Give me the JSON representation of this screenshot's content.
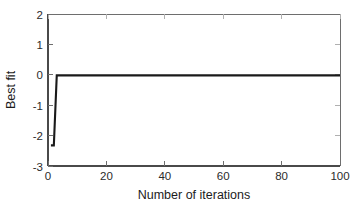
{
  "chart_data": {
    "type": "line",
    "title": "",
    "xlabel": "Number of iterations",
    "ylabel": "Best fit",
    "xlim": [
      0,
      100
    ],
    "ylim": [
      -3,
      2
    ],
    "xticks": [
      0,
      20,
      40,
      60,
      80,
      100
    ],
    "yticks": [
      2,
      1,
      0,
      -1,
      -2,
      -3
    ],
    "xtick_labels": [
      "0",
      "20",
      "40",
      "60",
      "80",
      "100"
    ],
    "ytick_labels": [
      "2",
      "1",
      "0",
      "-1",
      "-2",
      "-3"
    ],
    "grid": false,
    "legend": null,
    "series": [
      {
        "name": "Best fit",
        "color": "#1a1a1a",
        "x": [
          1,
          2,
          3,
          4,
          6,
          10,
          20,
          30,
          40,
          50,
          60,
          70,
          80,
          90,
          100
        ],
        "values": [
          -2.32,
          -2.32,
          -0.02,
          -0.02,
          -0.02,
          -0.02,
          -0.02,
          -0.02,
          -0.02,
          -0.02,
          -0.02,
          -0.02,
          -0.02,
          -0.02,
          -0.02
        ]
      }
    ],
    "annotations": []
  },
  "axes": {
    "x_title": "Number of iterations",
    "y_title": "Best fit",
    "x_tick_labels": [
      "0",
      "20",
      "40",
      "60",
      "80",
      "100"
    ],
    "y_tick_labels": [
      "2",
      "1",
      "0",
      "-1",
      "-2",
      "-3"
    ]
  },
  "colors": {
    "background": "#ffffff",
    "axis": "#6e6e6e",
    "data_line": "#1a1a1a",
    "text": "#1c1c1c"
  }
}
